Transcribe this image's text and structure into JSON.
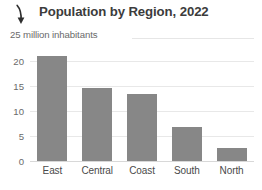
{
  "header": {
    "arrow_icon": "arrow-down-icon",
    "title": "Population by Region, 2022"
  },
  "subtitle": "25 million inhabitants",
  "chart_data": {
    "type": "bar",
    "title": "Population by Region, 2022",
    "subtitle": "25 million inhabitants",
    "categories": [
      "East",
      "Central",
      "Coast",
      "South",
      "North"
    ],
    "values": [
      21.0,
      14.6,
      13.5,
      6.9,
      2.7
    ],
    "xlabel": "",
    "ylabel": "25 million inhabitants",
    "ylim": [
      0,
      23.5
    ],
    "yticks": [
      0,
      5,
      10,
      15,
      20
    ],
    "ytick_labels": [
      "0",
      "5",
      "10",
      "15",
      "20"
    ],
    "grid": true,
    "legend": false,
    "bar_color": "#878787",
    "gridline_color": "#e8e8e8",
    "axis_text_color": "#6a6a6a",
    "title_color": "#3c3c3c"
  }
}
